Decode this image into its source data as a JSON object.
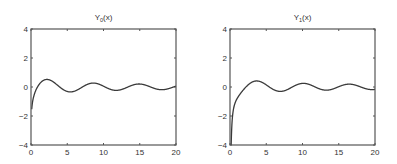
{
  "chart_data": [
    {
      "type": "line",
      "title": "Y0(x)",
      "title_main": "Y",
      "title_sub": "0",
      "title_tail": "(x)",
      "xlabel": "",
      "ylabel": "",
      "xlim": [
        0,
        20
      ],
      "ylim": [
        -4,
        4
      ],
      "xticks": [
        0,
        5,
        10,
        15,
        20
      ],
      "yticks": [
        -4,
        -2,
        0,
        2,
        4
      ],
      "xtick_labels": [
        "0",
        "5",
        "10",
        "15",
        "20"
      ],
      "ytick_labels": [
        "−4",
        "−2",
        "0",
        "2",
        "4"
      ],
      "grid": false,
      "function": "bessel_y0",
      "series": [
        {
          "name": "Y0(x)",
          "x": [
            0.1,
            0.5,
            1,
            2,
            2.2,
            3,
            4,
            5,
            5.5,
            6,
            7,
            8,
            8.6,
            9,
            10,
            11,
            11.8,
            12,
            13,
            14,
            15,
            15.9,
            17,
            18,
            18.2,
            19,
            20
          ],
          "values": [
            -1.53,
            -0.44,
            0.09,
            0.51,
            0.52,
            0.38,
            -0.02,
            -0.31,
            -0.34,
            -0.29,
            -0.03,
            0.22,
            0.27,
            0.25,
            0.06,
            -0.17,
            -0.22,
            -0.23,
            -0.08,
            0.13,
            0.21,
            0.19,
            -0.0,
            -0.19,
            -0.19,
            -0.11,
            0.06
          ]
        }
      ]
    },
    {
      "type": "line",
      "title": "Y1(x)",
      "title_main": "Y",
      "title_sub": "1",
      "title_tail": "(x)",
      "xlabel": "",
      "ylabel": "",
      "xlim": [
        0,
        20
      ],
      "ylim": [
        -4,
        4
      ],
      "xticks": [
        0,
        5,
        10,
        15,
        20
      ],
      "yticks": [
        -4,
        -2,
        0,
        2,
        4
      ],
      "xtick_labels": [
        "0",
        "5",
        "10",
        "15",
        "20"
      ],
      "ytick_labels": [
        "−4",
        "−2",
        "0",
        "2",
        "4"
      ],
      "grid": false,
      "function": "bessel_y1",
      "series": [
        {
          "name": "Y1(x)",
          "x": [
            0.16,
            0.3,
            0.5,
            1,
            2,
            3,
            3.7,
            4,
            5,
            6,
            7,
            8,
            9,
            10,
            10.2,
            11,
            12,
            13,
            13.3,
            14,
            15,
            16,
            16.5,
            17,
            18,
            19,
            20
          ],
          "values": [
            -4.0,
            -2.29,
            -1.47,
            -0.78,
            -0.11,
            0.32,
            0.42,
            0.4,
            0.15,
            -0.18,
            -0.3,
            -0.16,
            0.1,
            0.25,
            0.25,
            0.16,
            -0.06,
            -0.21,
            -0.22,
            -0.17,
            0.02,
            0.18,
            0.2,
            0.17,
            0.02,
            -0.16,
            -0.17
          ]
        }
      ]
    }
  ]
}
